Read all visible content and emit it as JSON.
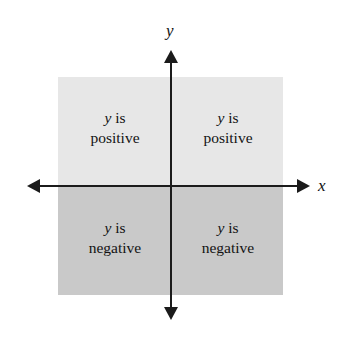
{
  "figure": {
    "background_color": "#ffffff",
    "width": 341,
    "height": 337
  },
  "axes": {
    "color": "#1b1b1b",
    "x_axis": {
      "label": "x",
      "arrow_left": "◀",
      "arrow_right": "▶"
    },
    "y_axis": {
      "label": "y",
      "arrow_up": "▲",
      "arrow_down": "▼"
    },
    "origin": {
      "x": 171,
      "y": 186
    }
  },
  "shading": {
    "upper_color": "#e7e7e7",
    "lower_color": "#c9c9c9",
    "box": {
      "left": 58,
      "top": 77,
      "width": 225,
      "height": 218
    }
  },
  "quadrants": [
    {
      "name": "upper-left",
      "variable": "y",
      "verb": "is",
      "sign": "positive",
      "line1": "y is",
      "line2": "positive",
      "fill": "#e7e7e7"
    },
    {
      "name": "upper-right",
      "variable": "y",
      "verb": "is",
      "sign": "positive",
      "line1": "y is",
      "line2": "positive",
      "fill": "#e7e7e7"
    },
    {
      "name": "lower-left",
      "variable": "y",
      "verb": "is",
      "sign": "negative",
      "line1": "y is",
      "line2": "negative",
      "fill": "#c9c9c9"
    },
    {
      "name": "lower-right",
      "variable": "y",
      "verb": "is",
      "sign": "negative",
      "line1": "y is",
      "line2": "negative",
      "fill": "#c9c9c9"
    }
  ]
}
